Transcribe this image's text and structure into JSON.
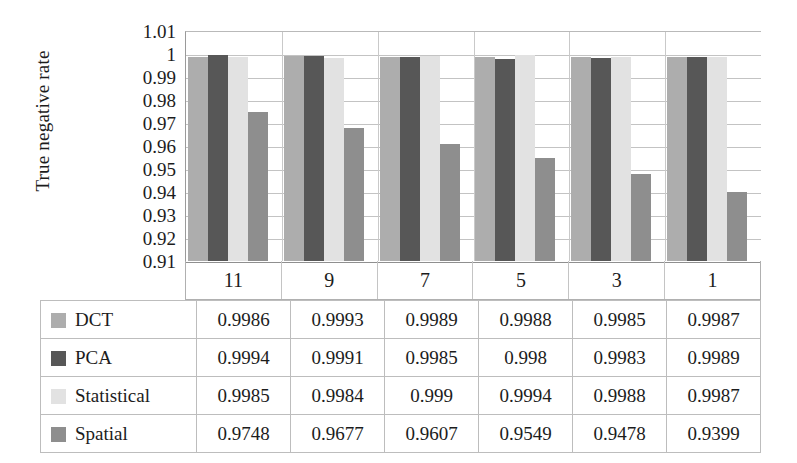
{
  "chart_data": {
    "type": "bar",
    "title": "",
    "xlabel": "",
    "ylabel": "True negative rate",
    "ylim": [
      0.91,
      1.01
    ],
    "ytick_step": 0.01,
    "grid": true,
    "legend_position": "table-left-column",
    "categories": [
      "11",
      "9",
      "7",
      "5",
      "3",
      "1"
    ],
    "ytick_labels": [
      "1.01",
      "1",
      "0.99",
      "0.98",
      "0.97",
      "0.96",
      "0.95",
      "0.94",
      "0.93",
      "0.92",
      "0.91"
    ],
    "series": [
      {
        "name": "DCT",
        "color": "#adadad",
        "values": [
          0.9986,
          0.9993,
          0.9989,
          0.9988,
          0.9985,
          0.9987
        ],
        "labels": [
          "0.9986",
          "0.9993",
          "0.9989",
          "0.9988",
          "0.9985",
          "0.9987"
        ]
      },
      {
        "name": "PCA",
        "color": "#575757",
        "values": [
          0.9994,
          0.9991,
          0.9985,
          0.998,
          0.9983,
          0.9989
        ],
        "labels": [
          "0.9994",
          "0.9991",
          "0.9985",
          "0.998",
          "0.9983",
          "0.9989"
        ]
      },
      {
        "name": "Statistical",
        "color": "#e2e2e2",
        "values": [
          0.9985,
          0.9984,
          0.999,
          0.9994,
          0.9988,
          0.9987
        ],
        "labels": [
          "0.9985",
          "0.9984",
          "0.999",
          "0.9994",
          "0.9988",
          "0.9987"
        ]
      },
      {
        "name": "Spatial",
        "color": "#8e8e8e",
        "values": [
          0.9748,
          0.9677,
          0.9607,
          0.9549,
          0.9478,
          0.9399
        ],
        "labels": [
          "0.9748",
          "0.9677",
          "0.9607",
          "0.9549",
          "0.9478",
          "0.9399"
        ]
      }
    ]
  },
  "colors": {
    "dct": "#adadad",
    "pca": "#575757",
    "statistical": "#e2e2e2",
    "spatial": "#8e8e8e",
    "gridline": "#c3c3c3",
    "table_border": "#bdbdbd",
    "text": "#1c1c1c"
  }
}
